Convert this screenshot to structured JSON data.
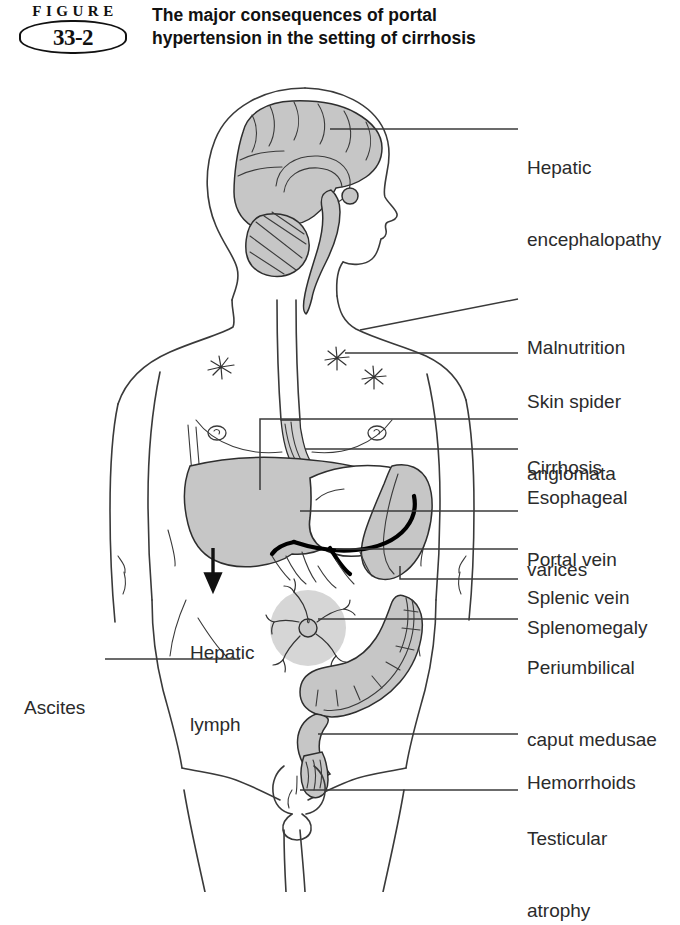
{
  "figure": {
    "word": "FIGURE",
    "number": "33-2",
    "title": "The major consequences of portal hypertension in the setting of cirrhosis"
  },
  "colors": {
    "organ_fill": "#c6c6c6",
    "line": "#3a3a3a",
    "text": "#2b2b2b",
    "vein": "#000000",
    "background": "#ffffff"
  },
  "labels_right": [
    {
      "id": "hepatic-encephalopathy",
      "line1": "Hepatic",
      "line2": "encephalopathy",
      "y": 108
    },
    {
      "id": "malnutrition",
      "line1": "Malnutrition",
      "line2": "",
      "y": 288
    },
    {
      "id": "skin-spider-angiomata",
      "line1": "Skin spider",
      "line2": "angiomata",
      "y": 342
    },
    {
      "id": "cirrhosis",
      "line1": "Cirrhosis",
      "line2": "",
      "y": 408
    },
    {
      "id": "esophageal-varices",
      "line1": "Esophageal",
      "line2": "varices",
      "y": 438
    },
    {
      "id": "portal-vein",
      "line1": "Portal vein",
      "line2": "",
      "y": 500
    },
    {
      "id": "splenic-vein",
      "line1": "Splenic vein",
      "line2": "",
      "y": 538
    },
    {
      "id": "splenomegaly",
      "line1": "Splenomegaly",
      "line2": "",
      "y": 568
    },
    {
      "id": "periumbilical-caput-medusae",
      "line1": "Periumbilical",
      "line2": "caput medusae",
      "y": 608
    },
    {
      "id": "hemorrhoids",
      "line1": "Hemorrhoids",
      "line2": "",
      "y": 723
    },
    {
      "id": "testicular-atrophy",
      "line1": "Testicular",
      "line2": "atrophy",
      "y": 779
    }
  ],
  "labels_left": [
    {
      "id": "ascites",
      "line1": "Ascites",
      "line2": "",
      "y": 648
    }
  ],
  "labels_inner": [
    {
      "id": "hepatic-lymph",
      "line1": "Hepatic",
      "line2": "lymph",
      "x": 190,
      "y": 593
    }
  ],
  "anatomy": {
    "organs": [
      "brain",
      "cerebellum",
      "brainstem",
      "esophagus",
      "liver",
      "stomach",
      "spleen",
      "portal-vein",
      "splenic-vein",
      "colon",
      "rectum",
      "umbilicus-caput-medusae",
      "scrotum",
      "nipples",
      "spider-angiomata"
    ]
  }
}
